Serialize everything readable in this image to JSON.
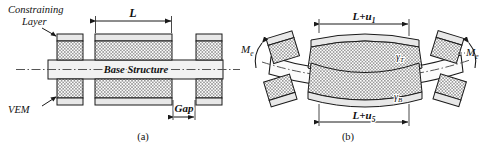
{
  "figure": {
    "type": "technical-diagram",
    "background": "#ffffff",
    "line_color": "#1a1a1a",
    "vem_fill": "#b9b9b9",
    "constraining_fill": "#e8e8e8",
    "base_fill": "#f2f2f2"
  },
  "panel_a": {
    "caption": "(a)",
    "labels": {
      "constraining_layer_line1": "Constraining",
      "constraining_layer_line2": "Layer",
      "vem": "VEM",
      "base_structure": "Base Structure",
      "patch_length": "L",
      "gap": "Gap"
    }
  },
  "panel_b": {
    "caption": "(b)",
    "labels": {
      "moment_left": "M",
      "moment_left_sub": "e",
      "moment_right": "M",
      "moment_right_sub": "e",
      "top_length": "L+u",
      "top_length_sub": "1",
      "bottom_length": "L+u",
      "bottom_length_sub": "5",
      "shear_top": "γ",
      "shear_top_sub": "T",
      "shear_bottom": "γ",
      "shear_bottom_sub": "B"
    }
  }
}
